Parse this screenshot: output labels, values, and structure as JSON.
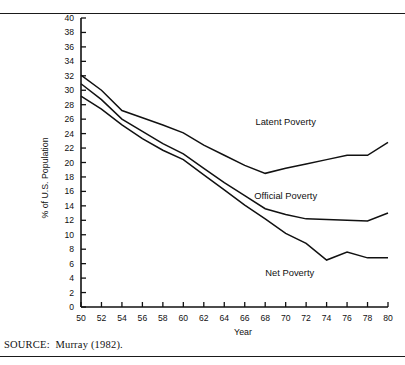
{
  "figure": {
    "source_note": "SOURCE:  Murray (1982)."
  },
  "chart_data": {
    "type": "line",
    "title": "",
    "xlabel": "Year",
    "ylabel": "% of U.S. Population",
    "xlim": [
      50,
      80
    ],
    "ylim": [
      0,
      40
    ],
    "grid": false,
    "legend_position": "inline-right",
    "x": [
      50,
      52,
      54,
      56,
      58,
      60,
      62,
      64,
      66,
      68,
      70,
      72,
      74,
      76,
      78,
      80
    ],
    "xticklabels": [
      "50",
      "52",
      "54",
      "56",
      "58",
      "60",
      "62",
      "64",
      "66",
      "68",
      "70",
      "72",
      "74",
      "76",
      "78",
      "80"
    ],
    "yticks": [
      0,
      2,
      4,
      6,
      8,
      10,
      12,
      14,
      16,
      18,
      20,
      22,
      24,
      26,
      28,
      30,
      32,
      34,
      36,
      38,
      40
    ],
    "yticklabels": [
      "0",
      "2",
      "4",
      "6",
      "8",
      "10",
      "12",
      "14",
      "16",
      "18",
      "20",
      "22",
      "24",
      "26",
      "28",
      "30",
      "32",
      "34",
      "36",
      "38",
      "40"
    ],
    "series": [
      {
        "name": "Latent Poverty",
        "label": "Latent Poverty",
        "color": "#111111",
        "values": [
          32.1,
          30.0,
          27.2,
          26.2,
          25.2,
          24.1,
          22.4,
          21.0,
          19.6,
          18.5,
          19.2,
          19.8,
          20.4,
          21.0,
          21.0,
          22.8
        ]
      },
      {
        "name": "Official Poverty",
        "label": "Official Poverty",
        "color": "#111111",
        "values": [
          30.9,
          28.7,
          26.0,
          24.3,
          22.6,
          21.2,
          19.2,
          17.2,
          15.4,
          13.6,
          12.8,
          12.2,
          12.1,
          12.0,
          11.9,
          13.0
        ]
      },
      {
        "name": "Net Poverty",
        "label": "Net Poverty",
        "color": "#111111",
        "values": [
          29.2,
          27.4,
          25.2,
          23.3,
          21.7,
          20.4,
          18.3,
          16.2,
          14.1,
          12.2,
          10.2,
          8.8,
          6.5,
          7.6,
          6.8,
          6.8
        ]
      }
    ],
    "annotations": [
      {
        "text": "Latent Poverty",
        "x": 70.0,
        "y": 25.2
      },
      {
        "text": "Official Poverty",
        "x": 70.0,
        "y": 15.0
      },
      {
        "text": "Net Poverty",
        "x": 70.4,
        "y": 4.3
      }
    ]
  }
}
